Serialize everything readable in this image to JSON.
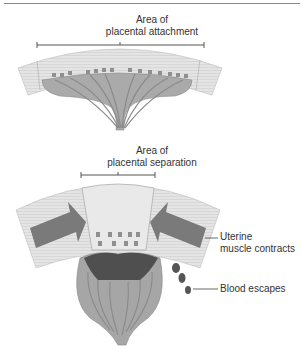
{
  "top_diagram": {
    "label_line1": "Area of",
    "label_line2": "placental attachment"
  },
  "bottom_diagram": {
    "label_line1": "Area of",
    "label_line2": "placental separation",
    "callout_uterine_line1": "Uterine",
    "callout_uterine_line2": "muscle contracts",
    "callout_blood": "Blood escapes"
  },
  "colors": {
    "muscle_wall": "#e2e2e2",
    "placenta": "#a8a8a8",
    "vessels": "#8c8c8c",
    "arrow": "#7a7a7a",
    "blood": "#555555"
  }
}
